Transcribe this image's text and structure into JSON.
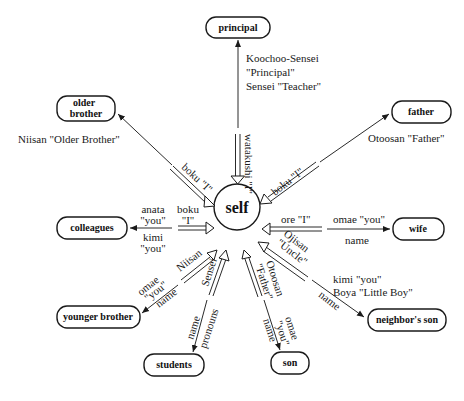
{
  "diagram": {
    "center": {
      "label": "self"
    },
    "nodes": [
      {
        "id": "principal",
        "label": "principal"
      },
      {
        "id": "older-brother",
        "label_line1": "older",
        "label_line2": "brother"
      },
      {
        "id": "father",
        "label": "father"
      },
      {
        "id": "colleagues",
        "label": "colleagues"
      },
      {
        "id": "wife",
        "label": "wife"
      },
      {
        "id": "younger-brother",
        "label": "younger brother"
      },
      {
        "id": "neighbors-son",
        "label": "neighbor's son"
      },
      {
        "id": "students",
        "label": "students"
      },
      {
        "id": "son",
        "label": "son"
      }
    ],
    "edges": {
      "principal": {
        "outgoing": [
          "Koochoo-Sensei",
          "\"Principal\"",
          "Sensei \"Teacher\""
        ],
        "self_term": "watakushi \"I\""
      },
      "older_brother": {
        "outgoing": "Niisan \"Older Brother\"",
        "self_term": "boku \"I\""
      },
      "father": {
        "outgoing": "Otoosan \"Father\"",
        "self_term": "boku \"I\""
      },
      "colleagues": {
        "outgoing_1": [
          "anata",
          "\"you\""
        ],
        "outgoing_2": [
          "kimi",
          "\"you\""
        ],
        "self_term": [
          "boku",
          "\"I\""
        ]
      },
      "wife": {
        "outgoing": "omae \"you\"",
        "outgoing_2": "name",
        "self_term": "ore \"I\""
      },
      "younger_brother": {
        "incoming_1": "omae",
        "incoming_2": "\"you\"",
        "incoming_3": "name",
        "self_term": "Niisan"
      },
      "neighbors_son": {
        "outgoing_1": "kimi \"you\"",
        "outgoing_2": "Boya \"Little Boy\"",
        "outgoing_3": "name",
        "self_term_1": "Ojisan",
        "self_term_2": "\"Uncle\""
      },
      "students": {
        "outgoing_1": "name",
        "outgoing_2": "pronouns",
        "self_term": "Sensei"
      },
      "son": {
        "outgoing_1": "omae",
        "outgoing_2": "\"you\"",
        "outgoing_3": "name",
        "self_term_1": "Otoosan",
        "self_term_2": "\"Father\""
      }
    }
  }
}
